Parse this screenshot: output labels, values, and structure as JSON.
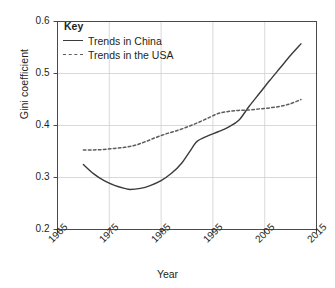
{
  "chart_data": {
    "type": "line",
    "title": "",
    "xlabel": "Year",
    "ylabel": "Gini coefficient",
    "xlim": [
      1965,
      2015
    ],
    "ylim": [
      0.2,
      0.6
    ],
    "xticks": [
      "1965",
      "1975",
      "1985",
      "1995",
      "2005",
      "2015"
    ],
    "yticks": [
      "0.2",
      "0.3",
      "0.4",
      "0.5",
      "0.6"
    ],
    "grid": true,
    "legend_position": "top-left",
    "legend_title": "Key",
    "series": [
      {
        "name": "Trends in China",
        "style": "solid",
        "color": "#3b3b3b",
        "x": [
          1970,
          1972,
          1974,
          1976,
          1978,
          1979,
          1981,
          1983,
          1985,
          1987,
          1989,
          1991,
          1992,
          1994,
          1996,
          1998,
          2000,
          2002,
          2004,
          2006,
          2008,
          2010,
          2012
        ],
        "y": [
          0.325,
          0.307,
          0.294,
          0.285,
          0.279,
          0.277,
          0.279,
          0.285,
          0.294,
          0.308,
          0.328,
          0.357,
          0.37,
          0.38,
          0.388,
          0.397,
          0.41,
          0.437,
          0.462,
          0.487,
          0.511,
          0.535,
          0.557
        ]
      },
      {
        "name": "Trends in the USA",
        "style": "dashed",
        "color": "#5c5c5c",
        "x": [
          1970,
          1972,
          1974,
          1976,
          1978,
          1980,
          1982,
          1984,
          1986,
          1988,
          1990,
          1992,
          1994,
          1996,
          1998,
          2000,
          2002,
          2004,
          2006,
          2008,
          2010,
          2012
        ],
        "y": [
          0.353,
          0.353,
          0.354,
          0.356,
          0.358,
          0.362,
          0.369,
          0.377,
          0.384,
          0.39,
          0.397,
          0.405,
          0.414,
          0.423,
          0.427,
          0.429,
          0.43,
          0.432,
          0.434,
          0.437,
          0.442,
          0.45
        ]
      }
    ],
    "annotations": [
      {
        "text": "China and USA lines cross near 2001 at about 0.433"
      }
    ]
  }
}
